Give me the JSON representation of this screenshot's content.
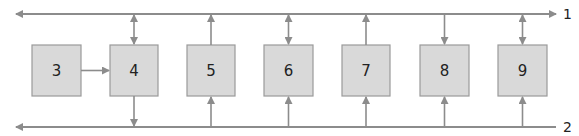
{
  "diagram": {
    "buses": [
      {
        "id": "1",
        "label": "1",
        "y": 14
      },
      {
        "id": "2",
        "label": "2",
        "y": 127
      }
    ],
    "boxes": [
      {
        "label": "3",
        "x": 32
      },
      {
        "label": "4",
        "x": 110
      },
      {
        "label": "5",
        "x": 187
      },
      {
        "label": "6",
        "x": 264
      },
      {
        "label": "7",
        "x": 342
      },
      {
        "label": "8",
        "x": 420
      },
      {
        "label": "9",
        "x": 498
      }
    ],
    "connections": [
      {
        "box": "3",
        "to": "4",
        "type": "arrow-right"
      },
      {
        "box": "4",
        "bus1": "bidirectional",
        "bus2": "to-bus"
      },
      {
        "box": "5",
        "bus1": "to-bus",
        "bus2": "from-bus"
      },
      {
        "box": "6",
        "bus1": "bidirectional",
        "bus2": "from-bus"
      },
      {
        "box": "7",
        "bus1": "to-bus",
        "bus2": "from-bus"
      },
      {
        "box": "8",
        "bus1": "from-bus",
        "bus2": "from-bus"
      },
      {
        "box": "9",
        "bus1": "bidirectional",
        "bus2": "from-bus"
      }
    ],
    "colors": {
      "line": "#8c8c8c",
      "box_fill": "#d9d9d9",
      "box_stroke": "#9a9a9a",
      "text": "#222222"
    }
  }
}
